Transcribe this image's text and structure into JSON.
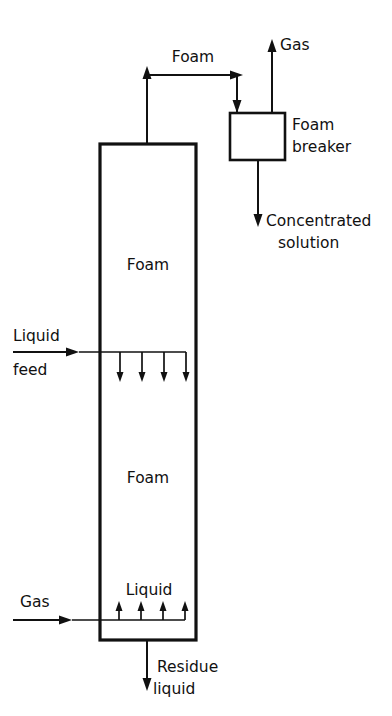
{
  "diagram": {
    "background_color": "#ffffff",
    "line_color": "#111111",
    "labels": {
      "foam_stream": "Foam",
      "gas_outlet": "Gas",
      "foam_breaker_line1": "Foam",
      "foam_breaker_line2": "breaker",
      "concentrated_line1": "Concentrated",
      "concentrated_line2": "solution",
      "foam_upper": "Foam",
      "foam_lower": "Foam",
      "liquid_feed_line1": "Liquid",
      "liquid_feed_line2": "feed",
      "liquid_pool": "Liquid",
      "gas_inlet": "Gas",
      "residue_line1": "Residue",
      "residue_line2": "liquid"
    },
    "equipment": [
      {
        "name": "foam-column",
        "label": "Foam fractionation column",
        "x": 100,
        "y": 144,
        "width": 96,
        "height": 496,
        "fill_pattern": "diagonal-hatch"
      },
      {
        "name": "foam-breaker",
        "label": "Foam breaker",
        "x": 230,
        "y": 113,
        "width": 55,
        "height": 47,
        "fill_pattern": "none"
      }
    ],
    "streams": [
      {
        "name": "foam-overhead",
        "label": "Foam",
        "direction": "up-right-down"
      },
      {
        "name": "gas-outlet",
        "label": "Gas",
        "direction": "up"
      },
      {
        "name": "concentrated-solution",
        "label": "Concentrated solution",
        "direction": "down"
      },
      {
        "name": "liquid-feed",
        "label": "Liquid feed",
        "direction": "right"
      },
      {
        "name": "gas-inlet",
        "label": "Gas",
        "direction": "right"
      },
      {
        "name": "residue-liquid",
        "label": "Residue liquid",
        "direction": "down"
      }
    ],
    "zones": [
      {
        "name": "foam-zone-upper",
        "label": "Foam",
        "from_y": 144,
        "to_y": 352
      },
      {
        "name": "foam-zone-lower",
        "label": "Foam",
        "from_y": 352,
        "to_y": 575
      },
      {
        "name": "liquid-pool-zone",
        "label": "Liquid",
        "from_y": 575,
        "to_y": 640
      }
    ],
    "internal_arrows": {
      "liquid_distributor_count": 4,
      "gas_sparger_count": 4
    }
  }
}
